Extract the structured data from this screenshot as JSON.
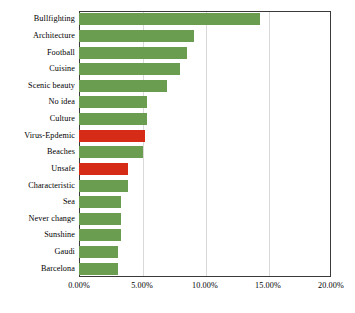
{
  "chart_data": {
    "type": "bar",
    "orientation": "horizontal",
    "title": "",
    "xlabel": "",
    "ylabel": "",
    "xlim": [
      0,
      20
    ],
    "xticks": [
      0,
      5,
      10,
      15,
      20
    ],
    "xtick_labels": [
      "0.00%",
      "5.00%",
      "10.00%",
      "15.00%",
      "20.00%"
    ],
    "grid": true,
    "grid_axis": "x",
    "legend": false,
    "unit": "%",
    "categories": [
      "Bullfighting",
      "Architecture",
      "Football",
      "Cuisine",
      "Scenic beauty",
      "No idea",
      "Culture",
      "Virus-Epdemic",
      "Beaches",
      "Unsafe",
      "Characteristic",
      "Sea",
      "Never change",
      "Sunshine",
      "Gaudi",
      "Barcelona"
    ],
    "values": [
      14.4,
      9.1,
      8.6,
      8.0,
      7.0,
      5.4,
      5.4,
      5.2,
      5.1,
      3.9,
      3.9,
      3.3,
      3.3,
      3.3,
      3.1,
      3.1
    ],
    "bar_colors": [
      "#6a9d4f",
      "#6a9d4f",
      "#6a9d4f",
      "#6a9d4f",
      "#6a9d4f",
      "#6a9d4f",
      "#6a9d4f",
      "#d62b16",
      "#6a9d4f",
      "#d62b16",
      "#6a9d4f",
      "#6a9d4f",
      "#6a9d4f",
      "#6a9d4f",
      "#6a9d4f",
      "#6a9d4f"
    ],
    "highlight_color": "#d62b16",
    "default_color": "#6a9d4f",
    "frame_color": "#3a3a3a",
    "gridline_color": "#d9d9d9",
    "background": "#ffffff"
  }
}
